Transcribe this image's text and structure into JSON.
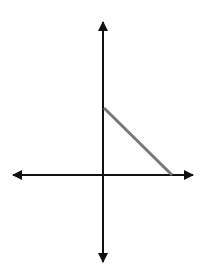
{
  "diagram": {
    "type": "coordinate-axes-with-segment",
    "axes": {
      "color": "#111111",
      "stroke_width": 2,
      "origin": [
        103,
        175
      ],
      "x_axis": {
        "from": [
          13,
          175
        ],
        "to": [
          193,
          175
        ],
        "arrows": "both"
      },
      "y_axis": {
        "from": [
          103,
          22
        ],
        "to": [
          103,
          262
        ],
        "arrows": "both"
      }
    },
    "segment": {
      "color": "#777777",
      "stroke_width": 3,
      "from": [
        104,
        108
      ],
      "to": [
        172,
        175
      ],
      "description": "line segment from positive y-axis intercept to positive x-axis intercept"
    }
  }
}
